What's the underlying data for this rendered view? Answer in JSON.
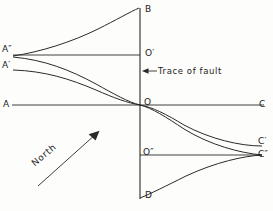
{
  "figure": {
    "ink_color": "#2a2a2a",
    "paper_color": "#fdfdfc"
  },
  "axes": {
    "vertical": {
      "name": "fault-trace-line",
      "top_label": "B",
      "bottom_label": "D",
      "x": 140,
      "y_top": 8,
      "y_bottom": 198
    },
    "horizontal": {
      "name": "main-horizontal-line",
      "left_label": "A",
      "right_label": "C",
      "y": 105
    },
    "upper_horizontal": {
      "name": "upper-horizontal-line",
      "left_label": "A″",
      "right_label": "O′",
      "y": 55
    },
    "lower_horizontal": {
      "name": "lower-horizontal-line",
      "left_label": "O″",
      "right_label": "C″",
      "y": 155
    }
  },
  "points": [
    {
      "id": "A",
      "label": "A",
      "base": "A",
      "prime": "",
      "x": 12,
      "y": 105
    },
    {
      "id": "A2",
      "label": "A″",
      "base": "A",
      "prime": "″",
      "x": 12,
      "y": 55
    },
    {
      "id": "A1",
      "label": "A′",
      "base": "A",
      "prime": "′",
      "x": 12,
      "y": 70
    },
    {
      "id": "B",
      "label": "B",
      "base": "B",
      "prime": "",
      "x": 140,
      "y": 8
    },
    {
      "id": "O1",
      "label": "O′",
      "base": "O",
      "prime": "′",
      "x": 140,
      "y": 55
    },
    {
      "id": "O",
      "label": "O",
      "base": "O",
      "prime": "",
      "x": 140,
      "y": 105
    },
    {
      "id": "O2",
      "label": "O″",
      "base": "O",
      "prime": "″",
      "x": 140,
      "y": 155
    },
    {
      "id": "D",
      "label": "D",
      "base": "D",
      "prime": "",
      "x": 140,
      "y": 198
    },
    {
      "id": "C",
      "label": "C",
      "base": "C",
      "prime": "",
      "x": 266,
      "y": 105
    },
    {
      "id": "C1",
      "label": "C′",
      "base": "C",
      "prime": "′",
      "x": 262,
      "y": 145
    },
    {
      "id": "C2",
      "label": "C″",
      "base": "C",
      "prime": "″",
      "x": 262,
      "y": 155
    }
  ],
  "annotations": {
    "trace": {
      "text": "Trace of fault",
      "arrow": "left-arrow-icon",
      "leader_from_x": 156,
      "leader_to_x": 142,
      "y": 72
    },
    "north": {
      "text": "North",
      "arrow": "north-arrow-icon",
      "from": [
        38,
        185
      ],
      "to": [
        98,
        132
      ],
      "angle_deg": -40
    }
  },
  "curves": [
    {
      "name": "curve-A2-to-B",
      "from": "A″",
      "to": "B",
      "path": "M 13,56 C 40,52 72,42 98,29 C 116,20 130,12 139,8"
    },
    {
      "name": "curve-A2-to-O-to-C2",
      "from": "A″",
      "to": "C″",
      "path": "M 13,57 C 45,60 70,70 96,84 C 114,94 128,102 140,105 C 152,108 166,117 184,129 C 210,145 240,153 262,155"
    },
    {
      "name": "curve-A1-to-O-to-C1",
      "from": "A′",
      "to": "C′",
      "path": "M 13,70 C 45,71 70,79 96,90 C 114,98 128,103 140,105 C 152,107 166,114 184,125 C 210,139 240,146 262,146"
    },
    {
      "name": "curve-D-to-C2",
      "from": "D",
      "to": "C″",
      "path": "M 140,198 C 150,194 166,186 186,176 C 216,162 244,156 262,155"
    }
  ]
}
